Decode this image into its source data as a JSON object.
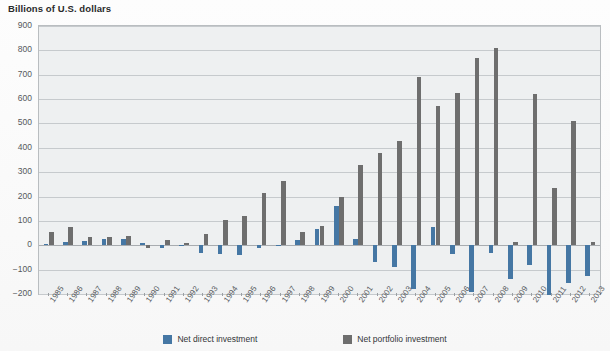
{
  "chart_data": {
    "type": "bar",
    "title": "Billions of U.S. dollars",
    "xlabel": "",
    "ylabel": "",
    "ylim": [
      -200,
      900
    ],
    "ytick_step": 100,
    "grid": true,
    "legend_position": "bottom",
    "yticks": [
      "900",
      "800",
      "700",
      "600",
      "500",
      "400",
      "300",
      "200",
      "100",
      "0",
      "-100",
      "-200"
    ],
    "categories": [
      "1985",
      "1986",
      "1987",
      "1988",
      "1989",
      "1990",
      "1991",
      "1992",
      "1993",
      "1994",
      "1995",
      "1996",
      "1997",
      "1998",
      "1999",
      "2000",
      "2001",
      "2002",
      "2003",
      "2004",
      "2005",
      "2006",
      "2007",
      "2008",
      "2009",
      "2010",
      "2011",
      "2012",
      "2013"
    ],
    "series": [
      {
        "name": "Net direct investment",
        "color": "#4577a4",
        "values": [
          5,
          15,
          17,
          25,
          25,
          10,
          -10,
          -5,
          -30,
          -35,
          -40,
          -10,
          -5,
          20,
          65,
          160,
          25,
          -70,
          -90,
          -180,
          75,
          -35,
          -190,
          -30,
          -140,
          -80,
          -205,
          -155,
          -125
        ]
      },
      {
        "name": "Net portfolio investment",
        "color": "#6e6e6e",
        "values": [
          55,
          75,
          35,
          35,
          40,
          -10,
          20,
          10,
          45,
          105,
          120,
          215,
          265,
          55,
          80,
          200,
          330,
          380,
          430,
          690,
          570,
          625,
          770,
          810,
          15,
          620,
          235,
          510,
          15
        ]
      }
    ]
  },
  "legend": {
    "items": [
      {
        "label": "Net direct investment",
        "swatch": "direct"
      },
      {
        "label": "Net portfolio investment",
        "swatch": "portfolio"
      }
    ]
  }
}
